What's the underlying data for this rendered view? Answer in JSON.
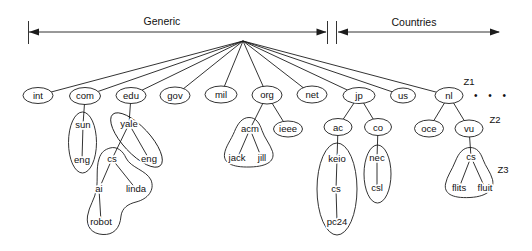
{
  "header": {
    "generic_label": "Generic",
    "countries_label": "Countries"
  },
  "zone_labels": {
    "z1": "Z1",
    "z2": "Z2",
    "z3": "Z3"
  },
  "ellipsis": "• • •",
  "nodes": {
    "int": "int",
    "com": "com",
    "edu": "edu",
    "gov": "gov",
    "mil": "mil",
    "org": "org",
    "net": "net",
    "jp": "jp",
    "us": "us",
    "nl": "nl",
    "sun": "sun",
    "eng_sun": "eng",
    "yale": "yale",
    "cs_yale": "cs",
    "eng_yale": "eng",
    "ai": "ai",
    "linda": "linda",
    "robot": "robot",
    "acm": "acm",
    "jack": "jack",
    "jill": "jill",
    "ieee": "ieee",
    "ac": "ac",
    "keio": "keio",
    "cs_keio": "cs",
    "pc24": "pc24",
    "co": "co",
    "nec": "nec",
    "csl": "csl",
    "oce": "oce",
    "vu": "vu",
    "cs_vu": "cs",
    "flits": "flits",
    "fluit": "fluit"
  },
  "hierarchy": {
    "root_children": [
      "int",
      "com",
      "edu",
      "gov",
      "mil",
      "org",
      "net",
      "jp",
      "us",
      "nl"
    ],
    "edges": [
      [
        "com",
        "sun"
      ],
      [
        "sun",
        "eng_sun"
      ],
      [
        "edu",
        "yale"
      ],
      [
        "yale",
        "cs_yale"
      ],
      [
        "yale",
        "eng_yale"
      ],
      [
        "cs_yale",
        "ai"
      ],
      [
        "cs_yale",
        "linda"
      ],
      [
        "ai",
        "robot"
      ],
      [
        "org",
        "acm"
      ],
      [
        "org",
        "ieee"
      ],
      [
        "acm",
        "jack"
      ],
      [
        "acm",
        "jill"
      ],
      [
        "jp",
        "ac"
      ],
      [
        "jp",
        "co"
      ],
      [
        "ac",
        "keio"
      ],
      [
        "keio",
        "cs_keio"
      ],
      [
        "cs_keio",
        "pc24"
      ],
      [
        "co",
        "nec"
      ],
      [
        "nec",
        "csl"
      ],
      [
        "nl",
        "oce"
      ],
      [
        "nl",
        "vu"
      ],
      [
        "vu",
        "cs_vu"
      ],
      [
        "cs_vu",
        "flits"
      ],
      [
        "cs_vu",
        "fluit"
      ]
    ]
  },
  "colors": {
    "line": "#1c1c1c",
    "background": "#ffffff",
    "text": "#111111"
  }
}
